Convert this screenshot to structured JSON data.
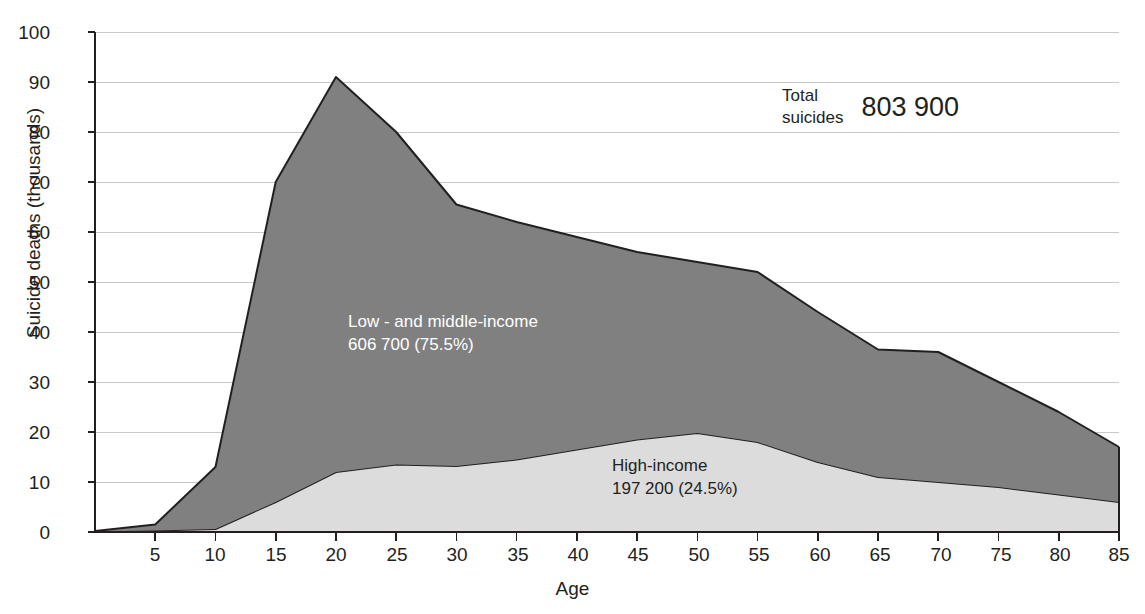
{
  "chart_data": {
    "type": "area",
    "title": "",
    "xlabel": "Age",
    "ylabel": "Suicide deaths (thousands)",
    "xlim": [
      0,
      85
    ],
    "ylim": [
      0,
      100
    ],
    "ytick_labels": [
      "100",
      "90",
      "80",
      "70",
      "60",
      "50",
      "40",
      "30",
      "20",
      "10",
      "0"
    ],
    "ytick_values": [
      100,
      90,
      80,
      70,
      60,
      50,
      40,
      30,
      20,
      10,
      0
    ],
    "xtick_labels": [
      "5",
      "10",
      "15",
      "20",
      "25",
      "30",
      "35",
      "40",
      "45",
      "50",
      "55",
      "60",
      "65",
      "70",
      "75",
      "80",
      "85"
    ],
    "xtick_values": [
      5,
      10,
      15,
      20,
      25,
      30,
      35,
      40,
      45,
      50,
      55,
      60,
      65,
      70,
      75,
      80,
      85
    ],
    "grid": true,
    "stacked": true,
    "x": [
      0,
      5,
      10,
      15,
      20,
      25,
      30,
      35,
      40,
      45,
      50,
      55,
      60,
      65,
      70,
      75,
      80,
      85
    ],
    "series": [
      {
        "name": "High-income",
        "color": "#dcdcdc",
        "values": [
          0.1,
          0.3,
          0.6,
          6.0,
          12.0,
          13.5,
          13.2,
          14.5,
          16.5,
          18.5,
          19.8,
          18.0,
          14.0,
          11.0,
          10.0,
          9.0,
          7.5,
          6.0
        ]
      },
      {
        "name": "Low - and middle-income",
        "color": "#808080",
        "values": [
          0.1,
          1.2,
          12.4,
          64.0,
          79.0,
          66.5,
          52.3,
          47.5,
          42.5,
          37.5,
          34.2,
          34.0,
          30.0,
          25.5,
          26.0,
          21.0,
          16.5,
          11.0
        ]
      }
    ],
    "totals": [
      0.2,
      1.5,
      13.0,
      70.0,
      91.0,
      80.0,
      65.5,
      62.0,
      59.0,
      56.0,
      54.0,
      52.0,
      44.0,
      36.5,
      36.0,
      30.0,
      24.0,
      17.0
    ],
    "annotations": {
      "low_middle_income": {
        "line1": "Low - and middle-income",
        "line2": "606 700 (75.5%)"
      },
      "high_income": {
        "line1": "High-income",
        "line2": "197 200 (24.5%)"
      },
      "total": {
        "label_line1": "Total",
        "label_line2": "suicides",
        "value": "803 900"
      }
    },
    "colors": {
      "low_middle_income_fill": "#808080",
      "high_income_fill": "#dcdcdc",
      "stroke": "#231f20",
      "grid": "#c9c9c9",
      "axis": "#231f20",
      "text": "#231f20",
      "text_on_dark": "#ffffff"
    }
  }
}
